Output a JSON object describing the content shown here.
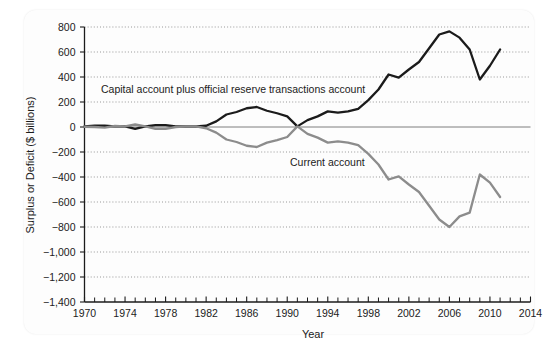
{
  "chart_data": {
    "type": "line",
    "title": "",
    "xlabel": "Year",
    "ylabel": "Surplus or Deficit ($ billions)",
    "xlim": [
      1970,
      2014
    ],
    "ylim": [
      -1400,
      800
    ],
    "grid": true,
    "legend_position": "inline-annotation",
    "y_ticks": [
      800,
      600,
      400,
      200,
      0,
      -200,
      -400,
      -600,
      -800,
      -1000,
      -1200,
      -1400
    ],
    "y_tick_labels": [
      "800",
      "600",
      "400",
      "200",
      "0",
      "−200",
      "−400",
      "−600",
      "−800",
      "−1,000",
      "−1,200",
      "−1,400"
    ],
    "x_ticks": [
      1970,
      1974,
      1978,
      1982,
      1986,
      1990,
      1994,
      1998,
      2002,
      2006,
      2010,
      2014
    ],
    "x_tick_labels": [
      "1970",
      "1974",
      "1978",
      "1982",
      "1986",
      "1990",
      "1994",
      "1998",
      "2002",
      "2006",
      "2010",
      "2014"
    ],
    "x_minor_tick_step": 1,
    "x": [
      1970,
      1971,
      1972,
      1973,
      1974,
      1975,
      1976,
      1977,
      1978,
      1979,
      1980,
      1981,
      1982,
      1983,
      1984,
      1985,
      1986,
      1987,
      1988,
      1989,
      1990,
      1991,
      1992,
      1993,
      1994,
      1995,
      1996,
      1997,
      1998,
      1999,
      2000,
      2001,
      2002,
      2003,
      2004,
      2005,
      2006,
      2007,
      2008,
      2009,
      2010,
      2011
    ],
    "series": [
      {
        "name": "Capital account plus official reserve transactions account",
        "color": "#1b1b1b",
        "values": [
          5,
          10,
          10,
          5,
          5,
          -15,
          5,
          15,
          15,
          5,
          5,
          5,
          10,
          45,
          100,
          120,
          150,
          160,
          130,
          110,
          85,
          5,
          55,
          85,
          125,
          115,
          125,
          145,
          215,
          300,
          420,
          395,
          460,
          520,
          630,
          740,
          765,
          715,
          620,
          380,
          490,
          620
        ]
      },
      {
        "name": "Current account",
        "color": "#8c8c8c",
        "values": [
          2,
          0,
          -5,
          8,
          5,
          20,
          5,
          -15,
          -15,
          0,
          5,
          5,
          -10,
          -45,
          -100,
          -120,
          -150,
          -160,
          -125,
          -105,
          -80,
          5,
          -55,
          -85,
          -125,
          -115,
          -125,
          -145,
          -215,
          -300,
          -420,
          -395,
          -460,
          -520,
          -630,
          -740,
          -800,
          -715,
          -685,
          -380,
          -445,
          -560
        ]
      }
    ],
    "annotations": [
      {
        "text": "Capital account plus official reserve transactions account",
        "x_px": 101,
        "y_px": 93,
        "series": "capital-account"
      },
      {
        "text": "Current account",
        "x_px": 290,
        "y_px": 166,
        "series": "current-account"
      }
    ]
  }
}
